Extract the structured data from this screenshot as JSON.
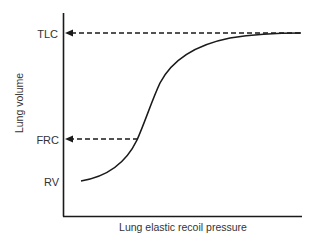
{
  "diagram": {
    "x_axis_label": "Lung elastic recoil pressure",
    "y_axis_label": "Lung volume",
    "y_markers": [
      {
        "id": "tlc",
        "label": "TLC",
        "y": 33,
        "has_arrow": true
      },
      {
        "id": "frc",
        "label": "FRC",
        "y": 139,
        "has_arrow": true
      },
      {
        "id": "rv",
        "label": "RV",
        "y": 181,
        "has_arrow": false
      }
    ],
    "colors": {
      "line": "#1a1a1a",
      "text": "#333333",
      "background": "#ffffff"
    }
  }
}
